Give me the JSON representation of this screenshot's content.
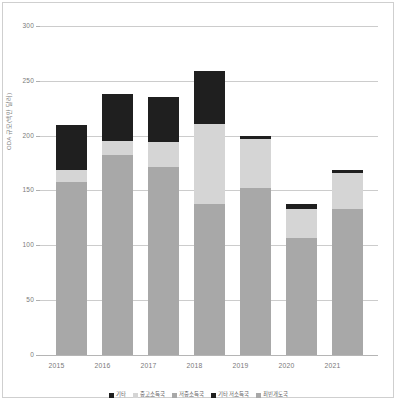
{
  "chart_data": {
    "type": "bar",
    "stacked": true,
    "title": "",
    "subtitle": "",
    "xlabel": "",
    "ylabel": "ODA 규모(백만 달러)",
    "categories": [
      "2015",
      "2016",
      "2017",
      "2018",
      "2019",
      "2020",
      "2021"
    ],
    "ylim": [
      0,
      300
    ],
    "yticks": [
      0,
      50,
      100,
      150,
      200,
      250,
      300
    ],
    "ytick_labels": [
      "0",
      "50",
      "100",
      "150",
      "200",
      "250",
      "300"
    ],
    "grid": true,
    "legend_position": "bottom",
    "series": [
      {
        "name": "기타",
        "color": "#a8a8a8",
        "values": [
          158,
          182,
          171,
          138,
          152,
          107,
          133
        ]
      },
      {
        "name": "중고소득국",
        "color": "#d5d5d5",
        "values": [
          11,
          13,
          23,
          73,
          45,
          26,
          33
        ]
      },
      {
        "name": "저중소득국",
        "color": "#1f1f1f",
        "values": [
          41,
          43,
          41,
          48,
          3,
          5,
          3
        ]
      },
      {
        "name": "기타 저소득국",
        "color": "#8f8f8f",
        "values": [
          0,
          0,
          0,
          0,
          0,
          0,
          0
        ]
      },
      {
        "name": "최빈개도국",
        "color": "#6f6f6f",
        "values": [
          0,
          0,
          0,
          0,
          0,
          0,
          0
        ]
      }
    ],
    "totals": [
      210,
      238,
      235,
      259,
      200,
      138,
      169
    ]
  },
  "legend": {
    "items": [
      {
        "label": "기타",
        "color": "#1f1f1f"
      },
      {
        "label": "중고소득국",
        "color": "#d5d5d5"
      },
      {
        "label": "저중소득국",
        "color": "#a8a8a8"
      },
      {
        "label": "기타 저소득국",
        "color": "#1f1f1f"
      },
      {
        "label": "최빈개도국",
        "color": "#a8a8a8"
      }
    ]
  },
  "axes": {
    "y_title": "ODA 규모(백만 달러)",
    "y_labels": [
      "300",
      "250",
      "200",
      "150",
      "100",
      "50",
      "0"
    ],
    "x_labels": [
      "2015",
      "2016",
      "2017",
      "2018",
      "2019",
      "2020",
      "2021"
    ]
  },
  "colors": {
    "segment_dark": "#1f1f1f",
    "segment_light": "#d5d5d5",
    "segment_mid": "#a8a8a8",
    "gridline": "#cccccc",
    "text": "#7a7a7a",
    "background": "#ffffff"
  }
}
